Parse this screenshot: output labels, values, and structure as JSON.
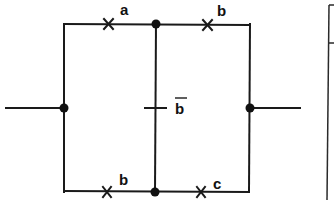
{
  "diagram": {
    "type": "switching-circuit",
    "contacts": {
      "top_left": {
        "label": "a",
        "kind": "normally-open"
      },
      "top_right": {
        "label": "b",
        "kind": "normally-open"
      },
      "middle": {
        "label": "b",
        "negated": true,
        "kind": "normally-closed"
      },
      "bottom_left": {
        "label": "b",
        "kind": "normally-open"
      },
      "bottom_right": {
        "label": "c",
        "kind": "normally-open"
      }
    },
    "colors": {
      "line": "#1a1a1a",
      "background": "#ffffff"
    }
  }
}
